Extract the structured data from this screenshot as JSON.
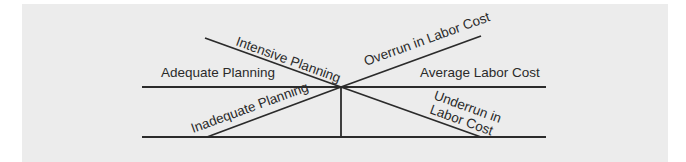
{
  "diagram": {
    "labels": {
      "intensive_planning": "Intensive Planning",
      "adequate_planning": "Adequate Planning",
      "inadequate_planning": "Inadequate Planning",
      "overrun_in_labor_cost": "Overrun in Labor Cost",
      "average_labor_cost": "Average Labor Cost",
      "underrun_line1": "Underrun in",
      "underrun_line2": "Labor Cost"
    },
    "colors": {
      "background": "#ececec",
      "line": "#2b2b2b",
      "text": "#2a2a2a"
    }
  }
}
